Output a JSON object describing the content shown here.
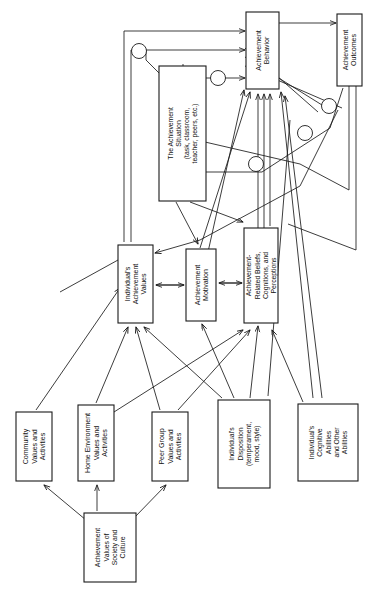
{
  "figure": {
    "type": "flow-diagram",
    "orientation": "rotated-90-ccw",
    "background_color": "#ffffff",
    "line_color": "#1a1a1a"
  },
  "nodes": [
    {
      "id": "achievement-behavior",
      "lines": [
        "Achievement",
        "Behavior"
      ],
      "x": 246,
      "y": 12,
      "w": 33,
      "h": 77
    },
    {
      "id": "achievement-outcomes",
      "lines": [
        "Achievement",
        "Outcomes"
      ],
      "x": 337,
      "y": 14,
      "w": 25,
      "h": 72
    },
    {
      "id": "achievement-situation",
      "lines": [
        "The Achievement",
        "Situation",
        "(task, classroom,",
        "teacher, peers, etc.)"
      ],
      "x": 159,
      "y": 66,
      "w": 47,
      "h": 135
    },
    {
      "id": "individuals-achievement-values",
      "lines": [
        "Individual's",
        "Achievement",
        "Values"
      ],
      "x": 118,
      "y": 245,
      "w": 35,
      "h": 78
    },
    {
      "id": "achievement-motivation",
      "lines": [
        "Achievement",
        "Motivation"
      ],
      "x": 186,
      "y": 249,
      "w": 30,
      "h": 72
    },
    {
      "id": "achievement-related-beliefs",
      "lines": [
        "Achievement-",
        "Related Beliefs,",
        "Cognitions, and",
        "Perceptions"
      ],
      "x": 244,
      "y": 228,
      "w": 34,
      "h": 95
    },
    {
      "id": "community-values",
      "lines": [
        "Community",
        "Values and",
        "Activities"
      ],
      "x": 16,
      "y": 412,
      "w": 36,
      "h": 69
    },
    {
      "id": "home-environment",
      "lines": [
        "Home Environment",
        "Values and",
        "Activities"
      ],
      "x": 78,
      "y": 405,
      "w": 36,
      "h": 76
    },
    {
      "id": "peer-group",
      "lines": [
        "Peer Group",
        "Values and",
        "Activities"
      ],
      "x": 152,
      "y": 412,
      "w": 36,
      "h": 69
    },
    {
      "id": "individuals-disposition",
      "lines": [
        "Individual's",
        "Disposition",
        "(temperament,",
        "mood, style)"
      ],
      "x": 218,
      "y": 400,
      "w": 52,
      "h": 88
    },
    {
      "id": "individuals-cognitive-abilities",
      "lines": [
        "Individual's",
        "Cognitive",
        "Abilities",
        "and Other",
        "Abilities"
      ],
      "x": 298,
      "y": 404,
      "w": 60,
      "h": 77
    },
    {
      "id": "achievement-values-society",
      "lines": [
        "Achievement",
        "Values of",
        "Society and",
        "Culture"
      ],
      "x": 84,
      "y": 513,
      "w": 52,
      "h": 69
    }
  ],
  "edges": [
    {
      "from": "achievement-behavior",
      "to": "achievement-outcomes"
    },
    {
      "from": "achievement-situation",
      "to": "achievement-behavior"
    },
    {
      "from": "achievement-situation",
      "to": "achievement-related-beliefs"
    },
    {
      "from": "achievement-situation",
      "to": "achievement-motivation"
    },
    {
      "from": "individuals-achievement-values",
      "to": "achievement-motivation"
    },
    {
      "from": "achievement-motivation",
      "to": "individuals-achievement-values"
    },
    {
      "from": "achievement-motivation",
      "to": "achievement-related-beliefs"
    },
    {
      "from": "achievement-related-beliefs",
      "to": "achievement-motivation"
    },
    {
      "from": "achievement-motivation",
      "to": "achievement-behavior"
    },
    {
      "from": "achievement-related-beliefs",
      "to": "achievement-behavior"
    },
    {
      "from": "individuals-achievement-values",
      "to": "achievement-behavior"
    },
    {
      "from": "community-values",
      "to": "individuals-achievement-values"
    },
    {
      "from": "home-environment",
      "to": "individuals-achievement-values"
    },
    {
      "from": "peer-group",
      "to": "individuals-achievement-values"
    },
    {
      "from": "home-environment",
      "to": "achievement-related-beliefs"
    },
    {
      "from": "peer-group",
      "to": "achievement-related-beliefs"
    },
    {
      "from": "individuals-disposition",
      "to": "individuals-achievement-values"
    },
    {
      "from": "individuals-disposition",
      "to": "achievement-motivation"
    },
    {
      "from": "individuals-disposition",
      "to": "achievement-related-beliefs"
    },
    {
      "from": "individuals-disposition",
      "to": "achievement-behavior"
    },
    {
      "from": "individuals-cognitive-abilities",
      "to": "achievement-related-beliefs"
    },
    {
      "from": "individuals-cognitive-abilities",
      "to": "achievement-behavior"
    },
    {
      "from": "achievement-values-society",
      "to": "community-values"
    },
    {
      "from": "achievement-values-society",
      "to": "home-environment"
    },
    {
      "from": "achievement-values-society",
      "to": "peer-group"
    },
    {
      "from": "achievement-outcomes",
      "to": "achievement-related-beliefs"
    },
    {
      "from": "achievement-outcomes",
      "to": "individuals-achievement-values"
    }
  ],
  "crossover_markers": 6
}
